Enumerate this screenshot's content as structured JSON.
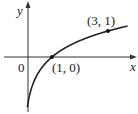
{
  "diagram": {
    "type": "function-graph",
    "function": "y = log_3(x)",
    "axes": {
      "x_label": "x",
      "y_label": "y",
      "origin_label": "0"
    },
    "points": [
      {
        "label": "(1, 0)",
        "x": 1,
        "y": 0
      },
      {
        "label": "(3, 1)",
        "x": 3,
        "y": 1
      }
    ],
    "colors": {
      "line": "#222222",
      "background": "#ffffff"
    }
  }
}
